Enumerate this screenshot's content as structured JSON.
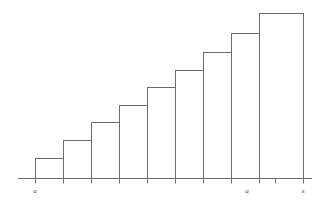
{
  "figure": {
    "background_color": "#ffffff",
    "line_color": "#6a6a6a",
    "label_color": "#4a4a4a"
  },
  "axis": {
    "name": "horizontal-axis",
    "x_start": 18,
    "x_end": 312,
    "y": 178,
    "tick_length": 5,
    "labels": [
      {
        "text": "a",
        "x": 35
      },
      {
        "text": "a",
        "x": 247
      },
      {
        "text": "x",
        "x": 303
      }
    ]
  },
  "chart_data": {
    "type": "bar",
    "xlabel": "",
    "ylabel": "",
    "grid": false,
    "legend": null,
    "categories": [
      "1",
      "2",
      "3",
      "4",
      "5",
      "6",
      "7",
      "8",
      "9"
    ],
    "values": [
      20,
      38,
      56,
      73,
      91,
      108,
      126,
      145,
      165
    ],
    "xlim": [
      35,
      303
    ],
    "ylim": [
      0,
      178
    ],
    "bar_width": 28,
    "baseline_y": 178,
    "bars": [
      {
        "index": 1,
        "x_left": 35,
        "x_right": 63,
        "top_y": 158,
        "height": 20
      },
      {
        "index": 2,
        "x_left": 63,
        "x_right": 91,
        "top_y": 140,
        "height": 38
      },
      {
        "index": 3,
        "x_left": 91,
        "x_right": 119,
        "top_y": 122,
        "height": 56
      },
      {
        "index": 4,
        "x_left": 119,
        "x_right": 147,
        "top_y": 105,
        "height": 73
      },
      {
        "index": 5,
        "x_left": 147,
        "x_right": 175,
        "top_y": 87,
        "height": 91
      },
      {
        "index": 6,
        "x_left": 175,
        "x_right": 203,
        "top_y": 70,
        "height": 108
      },
      {
        "index": 7,
        "x_left": 203,
        "x_right": 231,
        "top_y": 52,
        "height": 126
      },
      {
        "index": 8,
        "x_left": 231,
        "x_right": 259,
        "top_y": 33,
        "height": 145
      },
      {
        "index": 9,
        "x_left": 259,
        "x_right": 303,
        "top_y": 13,
        "height": 165
      }
    ],
    "tick_positions": [
      35,
      63,
      91,
      119,
      147,
      175,
      203,
      231,
      259,
      275,
      303
    ]
  }
}
